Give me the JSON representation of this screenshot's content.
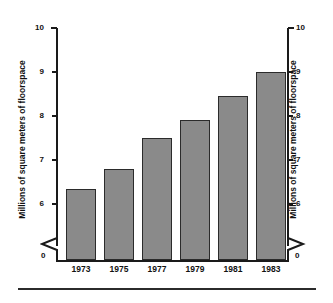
{
  "chart_data": {
    "type": "bar",
    "title": "",
    "xlabel": "",
    "ylabel": "Millions of square meters of floorspace",
    "ylabel_right": "Millions of square meters of floorspace",
    "categories": [
      "1973",
      "1975",
      "1977",
      "1979",
      "1981",
      "1983"
    ],
    "values": [
      6.35,
      6.8,
      7.5,
      7.9,
      8.45,
      9.0
    ],
    "ylim": [
      5,
      10
    ],
    "yticks": [
      "6",
      "7",
      "8",
      "9",
      "10"
    ],
    "ytick_values": [
      6,
      7,
      8,
      9,
      10
    ],
    "zero_label": "0",
    "axis_break": true,
    "grid": false,
    "legend": false,
    "bar_color": "#8a8a8a",
    "bar_outline_color": "#2b2b2b",
    "axis_color": "#1a1a1a",
    "background_color": "#ffffff"
  },
  "figure": {
    "break_symbol_name": "axis-break-zigzag"
  }
}
